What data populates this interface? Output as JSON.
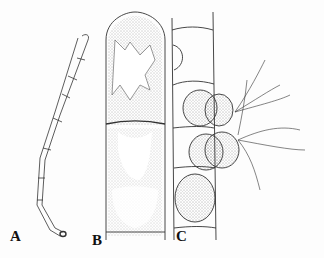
{
  "figure": {
    "panels": [
      {
        "id": "A",
        "label": "A",
        "description": "filament"
      },
      {
        "id": "B",
        "label": "B",
        "description": "apical cells"
      },
      {
        "id": "C",
        "label": "C",
        "description": "zoospores"
      }
    ]
  }
}
